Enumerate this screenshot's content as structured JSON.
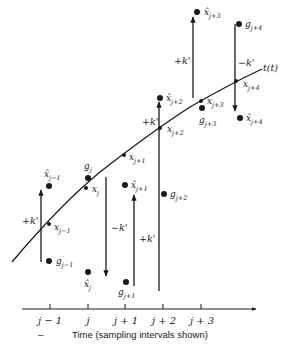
{
  "diagram": {
    "curve_label": "t(t)",
    "axis_title": "Time (sampling intervals shown)",
    "axis_dash": "–",
    "ticks": [
      "j − 1",
      "j",
      "j + 1",
      "j + 2",
      "j + 3"
    ],
    "true_points": [
      {
        "base": "x",
        "sub": "j−1"
      },
      {
        "base": "x",
        "sub": "j"
      },
      {
        "base": "x",
        "sub": "j+1"
      },
      {
        "base": "x",
        "sub": "j+2"
      },
      {
        "base": "x",
        "sub": "j+3"
      },
      {
        "base": "x",
        "sub": "j+4"
      }
    ],
    "estimates": [
      {
        "base": "x̂",
        "sub": "j−1"
      },
      {
        "base": "x̂",
        "sub": "j"
      },
      {
        "base": "x̂",
        "sub": "j+1"
      },
      {
        "base": "x̂",
        "sub": "j+2"
      },
      {
        "base": "x̂",
        "sub": "j+3"
      },
      {
        "base": "x̂",
        "sub": "j+4"
      }
    ],
    "measurements": [
      {
        "base": "g",
        "sub": "j−1"
      },
      {
        "base": "g",
        "sub": "j"
      },
      {
        "base": "g",
        "sub": "j+1"
      },
      {
        "base": "g",
        "sub": "j+2"
      },
      {
        "base": "g",
        "sub": "j+3"
      },
      {
        "base": "g",
        "sub": "j+4"
      }
    ],
    "corrections": [
      "+k'",
      "−k'",
      "+k'",
      "+k'",
      "+k'",
      "−k'"
    ]
  }
}
